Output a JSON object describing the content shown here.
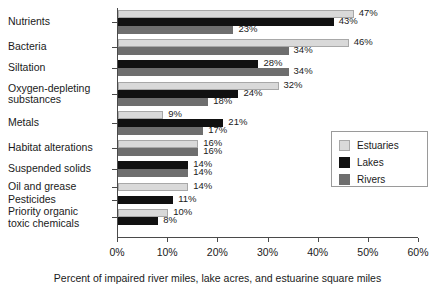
{
  "chart_data": {
    "type": "bar",
    "orientation": "horizontal",
    "title": "",
    "xlabel": "Percent of impaired river miles, lake acres, and estuarine square miles",
    "ylabel": "",
    "xlim": [
      0,
      60
    ],
    "xunit": "%",
    "grid": false,
    "legend_position": "right",
    "xticks": [
      "0%",
      "10%",
      "20%",
      "30%",
      "40%",
      "50%",
      "60%"
    ],
    "xtick_values": [
      0,
      10,
      20,
      30,
      40,
      50,
      60
    ],
    "categories": [
      "Nutrients",
      "Bacteria",
      "Siltation",
      "Oxygen-depleting\nsubstances",
      "Metals",
      "Habitat alterations",
      "Suspended solids",
      "Oil and grease",
      "Pesticides",
      "Priority organic\ntoxic chemicals"
    ],
    "series": [
      {
        "name": "Estuaries",
        "color": "#d9d9d9",
        "values": [
          47,
          46,
          null,
          32,
          9,
          16,
          null,
          14,
          null,
          10
        ],
        "labels": [
          "47%",
          "46%",
          null,
          "32%",
          "9%",
          "16%",
          null,
          "14%",
          null,
          "10%"
        ]
      },
      {
        "name": "Lakes",
        "color": "#111111",
        "values": [
          43,
          null,
          28,
          24,
          21,
          null,
          14,
          null,
          11,
          8
        ],
        "labels": [
          "43%",
          null,
          "28%",
          "24%",
          "21%",
          null,
          "14%",
          null,
          "11%",
          "8%"
        ]
      },
      {
        "name": "Rivers",
        "color": "#6e6e6e",
        "values": [
          23,
          34,
          34,
          18,
          17,
          16,
          14,
          null,
          null,
          null
        ],
        "labels": [
          "23%",
          "34%",
          "34%",
          "18%",
          "17%",
          "16%",
          "14%",
          null,
          null,
          null
        ]
      }
    ]
  },
  "legend": {
    "items": [
      {
        "label": "Estuaries",
        "color": "#d9d9d9"
      },
      {
        "label": "Lakes",
        "color": "#111111"
      },
      {
        "label": "Rivers",
        "color": "#6e6e6e"
      }
    ]
  },
  "axis": {
    "x_title": "Percent of impaired river miles, lake acres, and estuarine square miles"
  }
}
